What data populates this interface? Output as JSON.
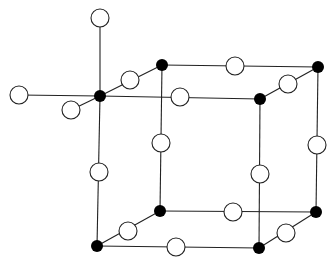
{
  "diagram": {
    "type": "crystal-lattice",
    "colors": {
      "line": "#222222",
      "filled_atom": "#000000",
      "open_atom_fill": "#ffffff",
      "open_atom_stroke": "#222222"
    },
    "filled_atoms": [
      {
        "id": "c-front-top-left",
        "x": 100,
        "y": 96
      },
      {
        "id": "c-back-top-left",
        "x": 162,
        "y": 65
      },
      {
        "id": "c-back-top-right",
        "x": 318,
        "y": 67
      },
      {
        "id": "c-front-top-right",
        "x": 260,
        "y": 99
      },
      {
        "id": "c-front-bottom-left",
        "x": 97,
        "y": 246
      },
      {
        "id": "c-back-bottom-left",
        "x": 160,
        "y": 211
      },
      {
        "id": "c-back-bottom-right",
        "x": 316,
        "y": 212
      },
      {
        "id": "c-front-bottom-right",
        "x": 259,
        "y": 248
      }
    ],
    "open_atoms": [
      {
        "id": "ext-top",
        "x": 100,
        "y": 18
      },
      {
        "id": "ext-left",
        "x": 19,
        "y": 95
      },
      {
        "id": "ext-front",
        "x": 71,
        "y": 110
      },
      {
        "id": "e-top-left-depth",
        "x": 130,
        "y": 80
      },
      {
        "id": "e-top-back",
        "x": 235,
        "y": 66
      },
      {
        "id": "e-top-right-depth",
        "x": 288,
        "y": 84
      },
      {
        "id": "e-top-front",
        "x": 180,
        "y": 97
      },
      {
        "id": "e-left-front-vert",
        "x": 99,
        "y": 172
      },
      {
        "id": "e-left-back-vert",
        "x": 161,
        "y": 143
      },
      {
        "id": "e-right-front-vert",
        "x": 260,
        "y": 174
      },
      {
        "id": "e-right-back-vert",
        "x": 317,
        "y": 145
      },
      {
        "id": "e-bottom-left-depth",
        "x": 128,
        "y": 231
      },
      {
        "id": "e-bottom-back",
        "x": 233,
        "y": 212
      },
      {
        "id": "e-bottom-front",
        "x": 176,
        "y": 247
      },
      {
        "id": "e-bottom-right-depth",
        "x": 286,
        "y": 233
      }
    ],
    "bonds": [
      [
        "ext-top",
        "c-front-top-left"
      ],
      [
        "ext-left",
        "c-front-top-left"
      ],
      [
        "ext-front",
        "c-front-top-left"
      ],
      [
        "c-front-top-left",
        "c-back-top-left"
      ],
      [
        "c-back-top-left",
        "c-back-top-right"
      ],
      [
        "c-back-top-right",
        "c-front-top-right"
      ],
      [
        "c-front-top-right",
        "c-front-top-left"
      ],
      [
        "c-front-top-left",
        "c-front-bottom-left"
      ],
      [
        "c-back-top-left",
        "c-back-bottom-left"
      ],
      [
        "c-back-top-right",
        "c-back-bottom-right"
      ],
      [
        "c-front-top-right",
        "c-front-bottom-right"
      ],
      [
        "c-front-bottom-left",
        "c-back-bottom-left"
      ],
      [
        "c-back-bottom-left",
        "c-back-bottom-right"
      ],
      [
        "c-back-bottom-right",
        "c-front-bottom-right"
      ],
      [
        "c-front-bottom-right",
        "c-front-bottom-left"
      ]
    ],
    "atom_radius": {
      "filled": 6,
      "open": 9
    }
  }
}
